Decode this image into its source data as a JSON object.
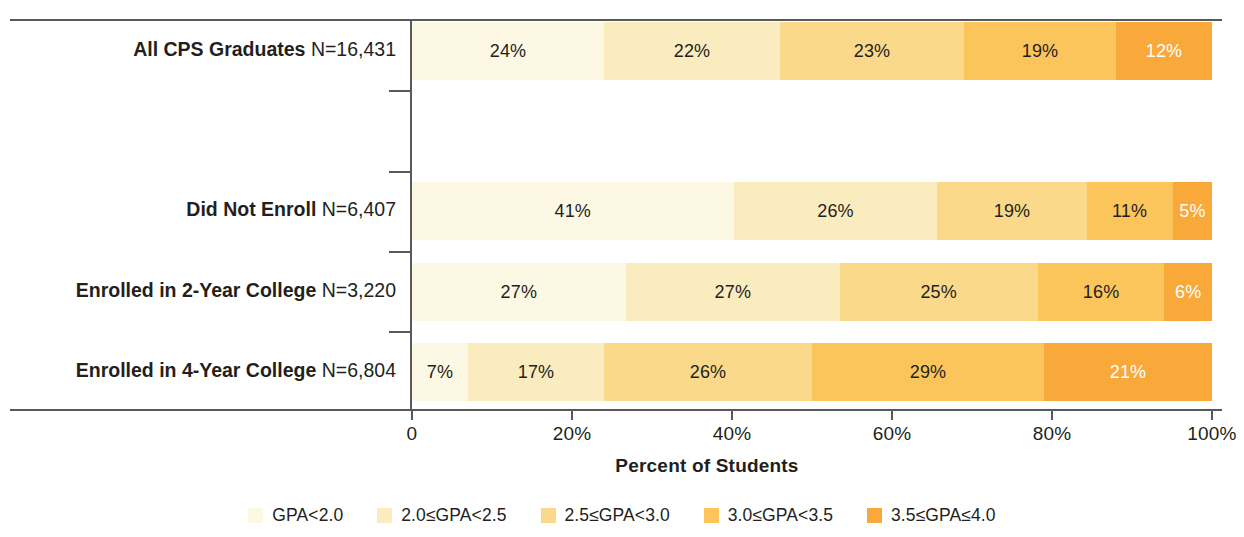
{
  "chart_data": {
    "type": "bar",
    "subtype": "horizontal-100-percent-stacked",
    "title": "",
    "xlabel": "Percent of Students",
    "ylabel": "",
    "xlim": [
      0,
      100
    ],
    "xticks": [
      "0",
      "20%",
      "40%",
      "60%",
      "80%",
      "100%"
    ],
    "xtick_values": [
      0,
      20,
      40,
      60,
      80,
      100
    ],
    "grid": false,
    "legend_position": "bottom",
    "categories": [
      "All CPS Graduates",
      "Did Not Enroll",
      "Enrolled in 2-Year College",
      "Enrolled in 4-Year College"
    ],
    "category_counts": [
      "N=16,431",
      "N=6,407",
      "N=3,220",
      "N=6,804"
    ],
    "series": [
      {
        "name": "GPA<2.0",
        "color": "#fdf8e3",
        "values": [
          24,
          41,
          27,
          7
        ]
      },
      {
        "name": "2.0≤GPA<2.5",
        "color": "#fbecc0",
        "values": [
          22,
          26,
          27,
          17
        ]
      },
      {
        "name": "2.5≤GPA<3.0",
        "color": "#fbd98b",
        "values": [
          23,
          19,
          25,
          26
        ]
      },
      {
        "name": "3.0≤GPA<3.5",
        "color": "#fcc55c",
        "values": [
          19,
          11,
          16,
          29
        ]
      },
      {
        "name": "3.5≤GPA≤4.0",
        "color": "#f9a83a",
        "values": [
          12,
          5,
          6,
          21
        ]
      }
    ],
    "rows": [
      {
        "label": "All CPS Graduates",
        "n": "N=16,431",
        "segments": [
          {
            "label": "24%",
            "value": 24,
            "text_color": "#231f20"
          },
          {
            "label": "22%",
            "value": 22,
            "text_color": "#231f20"
          },
          {
            "label": "23%",
            "value": 23,
            "text_color": "#231f20"
          },
          {
            "label": "19%",
            "value": 19,
            "text_color": "#231f20"
          },
          {
            "label": "12%",
            "value": 12,
            "text_color": "#ffffff"
          }
        ]
      },
      {
        "label": "Did Not Enroll",
        "n": "N=6,407",
        "segments": [
          {
            "label": "41%",
            "value": 41,
            "text_color": "#231f20"
          },
          {
            "label": "26%",
            "value": 26,
            "text_color": "#231f20"
          },
          {
            "label": "19%",
            "value": 19,
            "text_color": "#231f20"
          },
          {
            "label": "11%",
            "value": 11,
            "text_color": "#231f20"
          },
          {
            "label": "5%",
            "value": 5,
            "text_color": "#ffffff"
          }
        ]
      },
      {
        "label": "Enrolled in 2-Year College",
        "n": "N=3,220",
        "segments": [
          {
            "label": "27%",
            "value": 27,
            "text_color": "#231f20"
          },
          {
            "label": "27%",
            "value": 27,
            "text_color": "#231f20"
          },
          {
            "label": "25%",
            "value": 25,
            "text_color": "#231f20"
          },
          {
            "label": "16%",
            "value": 16,
            "text_color": "#231f20"
          },
          {
            "label": "6%",
            "value": 6,
            "text_color": "#ffffff"
          }
        ]
      },
      {
        "label": "Enrolled in 4-Year College",
        "n": "N=6,804",
        "segments": [
          {
            "label": "7%",
            "value": 7,
            "text_color": "#231f20"
          },
          {
            "label": "17%",
            "value": 17,
            "text_color": "#231f20"
          },
          {
            "label": "26%",
            "value": 26,
            "text_color": "#231f20"
          },
          {
            "label": "29%",
            "value": 29,
            "text_color": "#231f20"
          },
          {
            "label": "21%",
            "value": 21,
            "text_color": "#ffffff"
          }
        ]
      }
    ],
    "legend": [
      {
        "label": "GPA<2.0",
        "color": "#fdf8e3"
      },
      {
        "label": "2.0≤GPA<2.5",
        "color": "#fbecc0"
      },
      {
        "label": "2.5≤GPA<3.0",
        "color": "#fbd98b"
      },
      {
        "label": "3.0≤GPA<3.5",
        "color": "#fcc55c"
      },
      {
        "label": "3.5≤GPA≤4.0",
        "color": "#f9a83a"
      }
    ]
  },
  "layout": {
    "bar_tops": [
      22,
      182,
      263,
      343
    ],
    "bar_height": 58,
    "tick_tops": [
      90,
      171,
      251,
      331
    ],
    "plot_left": 412,
    "plot_width": 800
  }
}
